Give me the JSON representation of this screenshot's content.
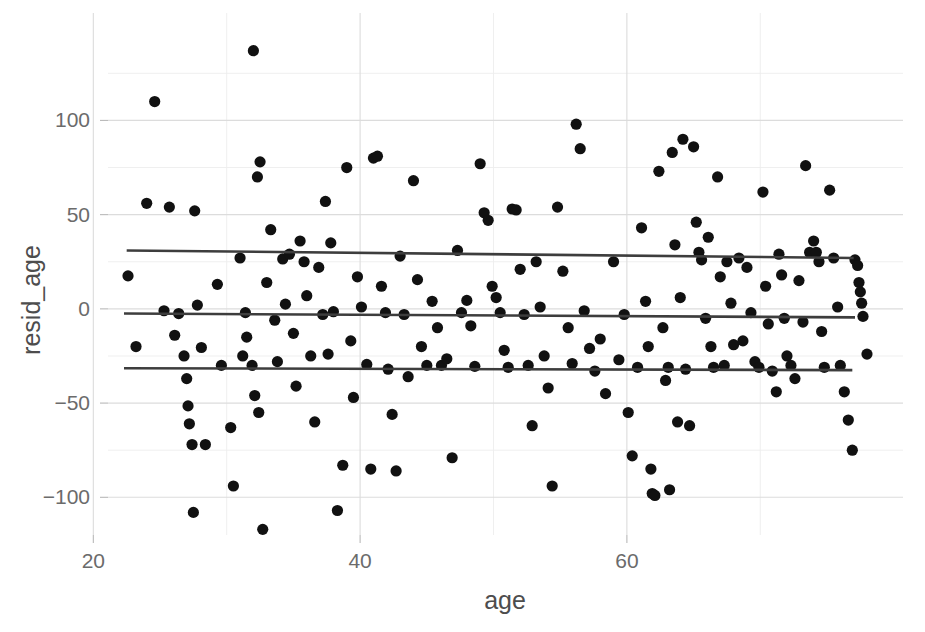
{
  "chart_data": {
    "type": "scatter",
    "title": "",
    "subtitle": "",
    "xlabel": "age",
    "ylabel": "resid_age",
    "xlim": [
      21.1,
      80.7
    ],
    "ylim": [
      -120,
      157
    ],
    "grid": true,
    "legend": "none",
    "x_ticks": [
      20,
      40,
      60
    ],
    "x_tick_labels": [
      "20",
      "40",
      "60"
    ],
    "x_minor_ticks": [
      30,
      50,
      70
    ],
    "y_ticks": [
      -100,
      -50,
      0,
      50,
      100
    ],
    "y_tick_labels": [
      "-100",
      "-50",
      "0",
      "50",
      "100"
    ],
    "y_minor_ticks": [
      -75,
      -25,
      25,
      75,
      125
    ],
    "point_color": "#111111",
    "line_color": "#3d3d3d",
    "grid_color": "#dcdcdc",
    "background": "#ffffff",
    "series": [
      {
        "name": "residuals",
        "marker": "filled-circle",
        "marker_radius": 5.6,
        "points": [
          [
            22.6,
            17.5
          ],
          [
            23.2,
            -20.0
          ],
          [
            24.0,
            56.0
          ],
          [
            24.6,
            110.0
          ],
          [
            25.3,
            -1.0
          ],
          [
            25.7,
            54.0
          ],
          [
            26.1,
            -14.0
          ],
          [
            26.4,
            -2.5
          ],
          [
            26.8,
            -25.0
          ],
          [
            27.0,
            -37.0
          ],
          [
            27.1,
            -51.5
          ],
          [
            27.2,
            -61.0
          ],
          [
            27.4,
            -72.0
          ],
          [
            27.5,
            -108.0
          ],
          [
            27.6,
            52.0
          ],
          [
            27.8,
            2.0
          ],
          [
            28.1,
            -20.5
          ],
          [
            28.4,
            -72.0
          ],
          [
            29.3,
            13.0
          ],
          [
            29.6,
            -30.0
          ],
          [
            30.3,
            -63.0
          ],
          [
            30.5,
            -94.0
          ],
          [
            31.0,
            27.0
          ],
          [
            31.2,
            -25.0
          ],
          [
            31.4,
            -2.0
          ],
          [
            31.5,
            -15.0
          ],
          [
            31.9,
            -30.0
          ],
          [
            32.0,
            137.0
          ],
          [
            32.1,
            -46.0
          ],
          [
            32.3,
            70.0
          ],
          [
            32.4,
            -55.0
          ],
          [
            32.5,
            78.0
          ],
          [
            32.7,
            -117.0
          ],
          [
            33.0,
            14.0
          ],
          [
            33.3,
            42.0
          ],
          [
            33.6,
            -6.0
          ],
          [
            33.8,
            -28.0
          ],
          [
            34.2,
            26.5
          ],
          [
            34.4,
            2.5
          ],
          [
            34.7,
            29.0
          ],
          [
            35.0,
            -13.0
          ],
          [
            35.2,
            -41.0
          ],
          [
            35.5,
            36.0
          ],
          [
            35.8,
            25.0
          ],
          [
            36.0,
            7.0
          ],
          [
            36.3,
            -25.0
          ],
          [
            36.6,
            -60.0
          ],
          [
            36.9,
            22.0
          ],
          [
            37.2,
            -3.0
          ],
          [
            37.4,
            57.0
          ],
          [
            37.6,
            -24.0
          ],
          [
            37.8,
            35.0
          ],
          [
            38.0,
            -1.5
          ],
          [
            38.3,
            -107.0
          ],
          [
            38.7,
            -83.0
          ],
          [
            39.0,
            75.0
          ],
          [
            39.3,
            -17.0
          ],
          [
            39.5,
            -47.0
          ],
          [
            39.8,
            17.0
          ],
          [
            40.1,
            1.0
          ],
          [
            40.5,
            -29.5
          ],
          [
            40.8,
            -85.0
          ],
          [
            41.0,
            80.0
          ],
          [
            41.3,
            81.0
          ],
          [
            41.6,
            12.0
          ],
          [
            41.9,
            -2.0
          ],
          [
            42.1,
            -32.0
          ],
          [
            42.4,
            -56.0
          ],
          [
            42.7,
            -86.0
          ],
          [
            43.0,
            28.0
          ],
          [
            43.3,
            -3.0
          ],
          [
            43.6,
            -36.0
          ],
          [
            44.0,
            68.0
          ],
          [
            44.3,
            15.5
          ],
          [
            44.6,
            -20.0
          ],
          [
            45.0,
            -30.0
          ],
          [
            45.4,
            4.0
          ],
          [
            45.8,
            -10.0
          ],
          [
            46.1,
            -30.0
          ],
          [
            46.5,
            -26.5
          ],
          [
            46.9,
            -79.0
          ],
          [
            47.3,
            31.0
          ],
          [
            47.6,
            -2.0
          ],
          [
            48.0,
            4.5
          ],
          [
            48.3,
            -9.0
          ],
          [
            48.6,
            -30.5
          ],
          [
            49.0,
            77.0
          ],
          [
            49.3,
            51.0
          ],
          [
            49.6,
            47.0
          ],
          [
            49.9,
            12.0
          ],
          [
            50.2,
            6.0
          ],
          [
            50.5,
            -2.0
          ],
          [
            50.8,
            -22.0
          ],
          [
            51.1,
            -31.0
          ],
          [
            51.4,
            53.0
          ],
          [
            51.7,
            52.5
          ],
          [
            52.0,
            21.0
          ],
          [
            52.3,
            -3.0
          ],
          [
            52.6,
            -30.0
          ],
          [
            52.9,
            -62.0
          ],
          [
            53.2,
            25.0
          ],
          [
            53.5,
            1.0
          ],
          [
            53.8,
            -25.0
          ],
          [
            54.1,
            -42.0
          ],
          [
            54.4,
            -94.0
          ],
          [
            54.8,
            54.0
          ],
          [
            55.2,
            20.0
          ],
          [
            55.6,
            -10.0
          ],
          [
            55.9,
            -29.0
          ],
          [
            56.2,
            98.0
          ],
          [
            56.5,
            85.0
          ],
          [
            56.8,
            -1.0
          ],
          [
            57.2,
            -21.0
          ],
          [
            57.6,
            -33.0
          ],
          [
            58.0,
            -16.0
          ],
          [
            58.4,
            -45.0
          ],
          [
            59.0,
            25.0
          ],
          [
            59.4,
            -27.0
          ],
          [
            59.8,
            -3.0
          ],
          [
            60.1,
            -55.0
          ],
          [
            60.4,
            -78.0
          ],
          [
            60.8,
            -31.0
          ],
          [
            61.1,
            43.0
          ],
          [
            61.4,
            4.0
          ],
          [
            61.6,
            -20.0
          ],
          [
            61.8,
            -85.0
          ],
          [
            61.9,
            -98.0
          ],
          [
            62.1,
            -99.0
          ],
          [
            62.4,
            73.0
          ],
          [
            62.7,
            -10.0
          ],
          [
            62.9,
            -38.0
          ],
          [
            63.1,
            -31.0
          ],
          [
            63.2,
            -96.0
          ],
          [
            63.4,
            83.0
          ],
          [
            63.6,
            34.0
          ],
          [
            63.8,
            -60.0
          ],
          [
            64.0,
            6.0
          ],
          [
            64.2,
            90.0
          ],
          [
            64.4,
            -32.0
          ],
          [
            64.7,
            -62.0
          ],
          [
            65.0,
            86.0
          ],
          [
            65.2,
            46.0
          ],
          [
            65.4,
            30.0
          ],
          [
            65.6,
            26.0
          ],
          [
            65.9,
            -5.0
          ],
          [
            66.1,
            38.0
          ],
          [
            66.3,
            -20.0
          ],
          [
            66.5,
            -31.0
          ],
          [
            66.8,
            70.0
          ],
          [
            67.0,
            17.0
          ],
          [
            67.3,
            -30.0
          ],
          [
            67.5,
            25.0
          ],
          [
            67.8,
            3.0
          ],
          [
            68.0,
            -19.0
          ],
          [
            68.4,
            27.0
          ],
          [
            68.7,
            -17.0
          ],
          [
            69.0,
            22.0
          ],
          [
            69.3,
            -2.0
          ],
          [
            69.6,
            -28.0
          ],
          [
            69.9,
            -31.0
          ],
          [
            70.2,
            62.0
          ],
          [
            70.4,
            12.0
          ],
          [
            70.6,
            -8.0
          ],
          [
            70.9,
            -33.0
          ],
          [
            71.2,
            -44.0
          ],
          [
            71.4,
            29.0
          ],
          [
            71.6,
            18.0
          ],
          [
            71.8,
            -5.0
          ],
          [
            72.0,
            -25.0
          ],
          [
            72.3,
            -30.0
          ],
          [
            72.6,
            -37.0
          ],
          [
            72.9,
            15.0
          ],
          [
            73.2,
            -7.0
          ],
          [
            73.4,
            76.0
          ],
          [
            73.7,
            30.0
          ],
          [
            74.0,
            36.0
          ],
          [
            74.2,
            30.0
          ],
          [
            74.4,
            25.0
          ],
          [
            74.6,
            -12.0
          ],
          [
            74.8,
            -31.0
          ],
          [
            75.2,
            63.0
          ],
          [
            75.5,
            27.0
          ],
          [
            75.8,
            1.0
          ],
          [
            76.0,
            -30.0
          ],
          [
            76.3,
            -44.0
          ],
          [
            76.6,
            -59.0
          ],
          [
            76.9,
            -75.0
          ],
          [
            77.1,
            26.0
          ],
          [
            77.3,
            23.0
          ],
          [
            77.4,
            14.0
          ],
          [
            77.5,
            9.0
          ],
          [
            77.6,
            3.0
          ],
          [
            77.7,
            -4.0
          ],
          [
            78.0,
            -24.0
          ]
        ]
      }
    ],
    "fit_lines": [
      {
        "name": "upper-band-line",
        "x0": 22.5,
        "y0": 31.0,
        "x1": 77.0,
        "y1": 27.0
      },
      {
        "name": "median-line",
        "x0": 22.3,
        "y0": -2.5,
        "x1": 77.1,
        "y1": -4.5
      },
      {
        "name": "lower-band-line",
        "x0": 22.3,
        "y0": -31.5,
        "x1": 76.9,
        "y1": -32.5
      }
    ]
  }
}
